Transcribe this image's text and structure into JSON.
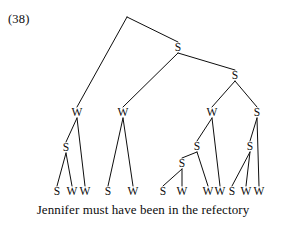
{
  "figure": {
    "example_number": "(38)",
    "sentence": "Jennifer must have been in the refectory",
    "ink_color": "#0d0d0d",
    "background_color": "#ffffff"
  },
  "tree": {
    "description": "Binary syntactic derivation tree with S and W node labels over the sentence",
    "nodes": [
      {
        "id": "root",
        "label": "",
        "x": 127,
        "y": 17
      },
      {
        "id": "s1",
        "label": "S",
        "x": 178,
        "y": 48
      },
      {
        "id": "s2",
        "label": "S",
        "x": 235,
        "y": 76
      },
      {
        "id": "w1",
        "label": "W",
        "x": 77,
        "y": 113
      },
      {
        "id": "w2",
        "label": "W",
        "x": 123,
        "y": 113
      },
      {
        "id": "w3",
        "label": "W",
        "x": 212,
        "y": 113
      },
      {
        "id": "s3",
        "label": "S",
        "x": 257,
        "y": 113
      },
      {
        "id": "s4",
        "label": "S",
        "x": 66,
        "y": 148
      },
      {
        "id": "s5",
        "label": "S",
        "x": 197,
        "y": 147
      },
      {
        "id": "s6",
        "label": "S",
        "x": 250,
        "y": 147
      },
      {
        "id": "s7",
        "label": "S",
        "x": 182,
        "y": 164
      },
      {
        "id": "leaf1",
        "label": "S",
        "x": 57,
        "y": 192
      },
      {
        "id": "leaf2",
        "label": "W",
        "x": 72,
        "y": 192
      },
      {
        "id": "leaf3",
        "label": "W",
        "x": 85,
        "y": 192
      },
      {
        "id": "leaf4",
        "label": "S",
        "x": 108,
        "y": 192
      },
      {
        "id": "leaf5",
        "label": "W",
        "x": 133,
        "y": 192
      },
      {
        "id": "leaf6",
        "label": "S",
        "x": 163,
        "y": 192
      },
      {
        "id": "leaf7",
        "label": "W",
        "x": 182,
        "y": 192
      },
      {
        "id": "leaf8",
        "label": "W",
        "x": 208,
        "y": 192
      },
      {
        "id": "leaf9",
        "label": "W",
        "x": 220,
        "y": 192
      },
      {
        "id": "leaf10",
        "label": "S",
        "x": 232,
        "y": 192
      },
      {
        "id": "leaf11",
        "label": "W",
        "x": 246,
        "y": 192
      },
      {
        "id": "leaf12",
        "label": "W",
        "x": 259,
        "y": 192
      }
    ],
    "edges": [
      {
        "from": "root",
        "to": "w1"
      },
      {
        "from": "root",
        "to": "s1"
      },
      {
        "from": "s1",
        "to": "w2"
      },
      {
        "from": "s1",
        "to": "s2"
      },
      {
        "from": "s2",
        "to": "w3"
      },
      {
        "from": "s2",
        "to": "s3"
      },
      {
        "from": "w1",
        "to": "s4"
      },
      {
        "from": "w1",
        "to": "leaf3"
      },
      {
        "from": "s4",
        "to": "leaf1"
      },
      {
        "from": "s4",
        "to": "leaf2"
      },
      {
        "from": "w2",
        "to": "leaf4"
      },
      {
        "from": "w2",
        "to": "leaf5"
      },
      {
        "from": "w3",
        "to": "s5"
      },
      {
        "from": "w3",
        "to": "leaf9"
      },
      {
        "from": "s5",
        "to": "s7"
      },
      {
        "from": "s5",
        "to": "leaf8"
      },
      {
        "from": "s7",
        "to": "leaf6"
      },
      {
        "from": "s7",
        "to": "leaf7"
      },
      {
        "from": "s3",
        "to": "s6"
      },
      {
        "from": "s3",
        "to": "leaf12"
      },
      {
        "from": "s6",
        "to": "leaf10"
      },
      {
        "from": "s6",
        "to": "leaf11"
      }
    ],
    "leaf_sequence": [
      "S",
      "W",
      "W",
      "S",
      "W",
      "S",
      "W",
      "W",
      "W",
      "S",
      "W",
      "W"
    ]
  }
}
